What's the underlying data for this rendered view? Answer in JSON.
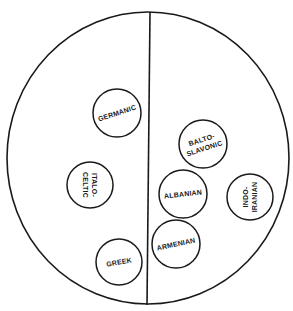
{
  "diagram": {
    "outer_circle": {
      "cx": 148,
      "cy": 158,
      "rx": 141,
      "ry": 146
    },
    "divider": {
      "x1": 150,
      "y1": 12,
      "x2": 147,
      "y2": 305
    },
    "stroke_color": "#1a1a1a",
    "nodes": [
      {
        "id": "germanic",
        "lines": [
          "GERMANIC"
        ],
        "cx": 117,
        "cy": 113,
        "r": 24,
        "rotate": -18,
        "vertical": false
      },
      {
        "id": "italo-celtic",
        "lines": [
          "ITALO-",
          "CELTIC"
        ],
        "cx": 90,
        "cy": 185,
        "r": 23,
        "rotate": 90,
        "vertical": true
      },
      {
        "id": "greek",
        "lines": [
          "GREEK"
        ],
        "cx": 119,
        "cy": 262,
        "r": 23,
        "rotate": -10,
        "vertical": false
      },
      {
        "id": "balto-slavonic",
        "lines": [
          "BALTO-",
          "SLAVONIC"
        ],
        "cx": 203,
        "cy": 144,
        "r": 24,
        "rotate": -18,
        "vertical": false
      },
      {
        "id": "albanian",
        "lines": [
          "ALBANIAN"
        ],
        "cx": 183,
        "cy": 194,
        "r": 24,
        "rotate": -6,
        "vertical": false
      },
      {
        "id": "indo-iranian",
        "lines": [
          "INDO-",
          "IRANIAN"
        ],
        "cx": 250,
        "cy": 197,
        "r": 23,
        "rotate": -90,
        "vertical": true
      },
      {
        "id": "armenian",
        "lines": [
          "ARMENIAN"
        ],
        "cx": 176,
        "cy": 244,
        "r": 24,
        "rotate": -12,
        "vertical": false
      }
    ]
  }
}
